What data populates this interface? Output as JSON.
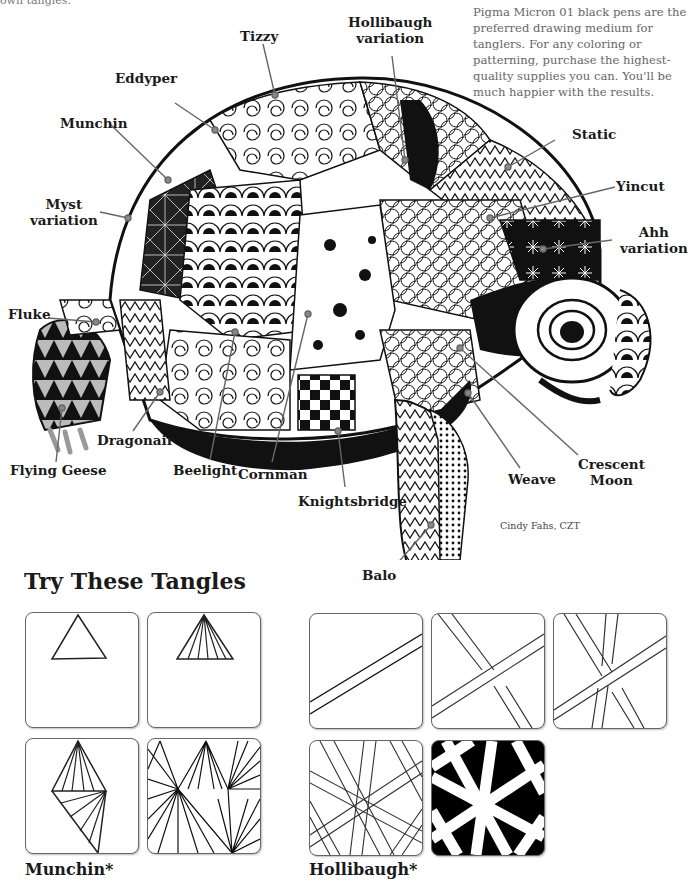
{
  "page": {
    "top_cut_text": "own tangles.",
    "note": "Pigma Micron 01 black pens are the preferred drawing medium for tanglers. For any coloring or patterning, purchase the highest-quality supplies you can. You'll be much happier with the results.",
    "credit": "Cindy Fahs, CZT"
  },
  "illustration": {
    "subject": "tangled turtle",
    "labels": [
      {
        "text": "Tizzy"
      },
      {
        "text": "Hollibaugh\nvariation"
      },
      {
        "text": "Eddyper"
      },
      {
        "text": "Munchin"
      },
      {
        "text": "Static"
      },
      {
        "text": "Yincut"
      },
      {
        "text": "Myst\nvariation"
      },
      {
        "text": "Ahh\nvariation"
      },
      {
        "text": "Fluke"
      },
      {
        "text": "Dragonair"
      },
      {
        "text": "Flying Geese"
      },
      {
        "text": "Beelight"
      },
      {
        "text": "Cornman"
      },
      {
        "text": "Knightsbridge"
      },
      {
        "text": "Weave"
      },
      {
        "text": "Crescent\nMoon"
      },
      {
        "text": "Balo"
      }
    ]
  },
  "section": {
    "heading": "Try These Tangles",
    "groups": [
      {
        "caption": "Munchin*",
        "steps": 4
      },
      {
        "caption": "Hollibaugh*",
        "steps": 5
      }
    ]
  }
}
